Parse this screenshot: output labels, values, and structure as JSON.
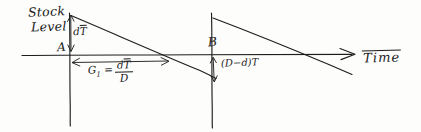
{
  "diagram": {
    "kind": "hand-drawn sketch",
    "axes": {
      "y_axis_label_line1": "Stock",
      "y_axis_label_line2": "Level",
      "x_axis_label": "Time"
    },
    "points": [
      {
        "name": "point-a",
        "label": "A"
      },
      {
        "name": "point-b",
        "label": "B"
      }
    ],
    "annotations": {
      "vertical_rise_label": "dT",
      "vertical_rise_overline": "T",
      "vertical_rise_prefix": "d",
      "cycle_length_lhs": "G",
      "cycle_length_subscript": "1",
      "cycle_length_equals": "=",
      "cycle_length_numerator_prefix": "d",
      "cycle_length_numerator_overline": "T",
      "cycle_length_denominator": "D",
      "drop_label": "(D−d)T"
    },
    "colors": {
      "ink": "#1d1d1d",
      "paper": "#fdfdfc"
    }
  }
}
